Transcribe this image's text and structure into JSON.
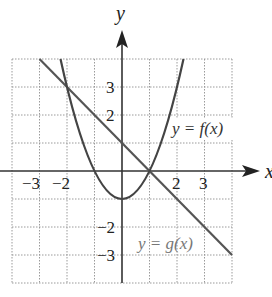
{
  "figure": {
    "x_axis_label": "x",
    "y_axis_label": "y",
    "x_tick_labels": [
      {
        "value": -3,
        "text": "−3"
      },
      {
        "value": -2,
        "text": "−2"
      },
      {
        "value": 2,
        "text": "2"
      },
      {
        "value": 3,
        "text": "3"
      }
    ],
    "y_tick_labels": [
      {
        "value": 3,
        "text": "3"
      },
      {
        "value": 2,
        "text": "2"
      },
      {
        "value": -2,
        "text": "−2"
      },
      {
        "value": -3,
        "text": "−3"
      }
    ],
    "grid": {
      "x_range": [
        -4,
        4
      ],
      "y_range": [
        -4,
        4
      ],
      "step": 1,
      "style": "dotted"
    },
    "curves": [
      {
        "name": "f",
        "label": "y = f(x)",
        "type": "parabola",
        "equation": "y = x^2 - 1",
        "color": "#444444"
      },
      {
        "name": "g",
        "label": "y = g(x)",
        "type": "line",
        "equation": "y = -x + 1",
        "color": "#555555"
      }
    ],
    "intersections": [
      [
        -2,
        3
      ],
      [
        1,
        0
      ]
    ],
    "colors": {
      "axis": "#333333",
      "grid": "#9a9a9a",
      "f_label": "#333333",
      "g_label": "#777777"
    }
  }
}
